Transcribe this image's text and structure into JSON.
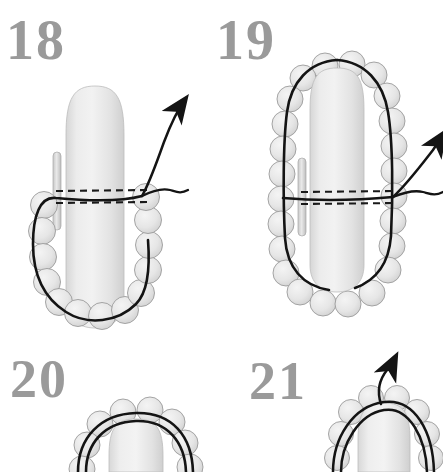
{
  "document": {
    "type": "illustrated-instruction-diagram",
    "subject": "beaded bezel / peyote stitch around a finger form",
    "background_color": "#ffffff",
    "numeral_color": "#9a9a9a",
    "bead_fill_color": "#e8e8e8",
    "bead_outline_color": "#9b9b9b",
    "form_fill_color": "#e4e4e4",
    "thread_color": "#1a1a1a"
  },
  "panels": [
    {
      "id": "panel-18",
      "number": "18",
      "elements": {
        "form": "finger-form",
        "needle": "needle",
        "beads": "bead-ring-lower",
        "thread": "thread-solid",
        "hidden_thread": "thread-dashed",
        "arrow": "thread-arrow-up-right"
      }
    },
    {
      "id": "panel-19",
      "number": "19",
      "elements": {
        "form": "finger-form",
        "needle": "needle",
        "beads": "bead-ring-full",
        "thread": "thread-solid",
        "hidden_thread": "thread-dashed",
        "arrow": "thread-arrow-up-right"
      }
    },
    {
      "id": "panel-20",
      "number": "20",
      "elements": {
        "form": "finger-form",
        "beads": "bead-cap",
        "thread": "thread-double-strand"
      }
    },
    {
      "id": "panel-21",
      "number": "21",
      "elements": {
        "form": "finger-form",
        "beads": "bead-cap",
        "thread": "thread-double-strand",
        "arrow": "thread-arrow-up"
      }
    }
  ]
}
